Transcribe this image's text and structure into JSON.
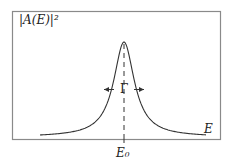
{
  "figure": {
    "y_axis_label": "|A(E)|²",
    "x_axis_label": "E",
    "center_tick_label": "E₀",
    "width_label": "Γ",
    "colors": {
      "frame": "#8a8a8a",
      "curve": "#333333",
      "text": "#222222"
    }
  },
  "chart_data": {
    "type": "line",
    "title": "",
    "xlabel": "E",
    "ylabel": "|A(E)|²",
    "annotations": [
      {
        "text": "E₀",
        "meaning": "resonance center, marked by dashed vertical line"
      },
      {
        "text": "Γ",
        "meaning": "full width at half maximum, indicated by inward arrows"
      }
    ],
    "grid": false,
    "legend": null,
    "x": [
      -7,
      -5,
      -3,
      -2,
      -1,
      -0.5,
      0,
      0.5,
      1,
      2,
      3,
      5,
      7
    ],
    "values": [
      0.02,
      0.038,
      0.1,
      0.2,
      0.5,
      0.8,
      1.0,
      0.8,
      0.5,
      0.2,
      0.1,
      0.038,
      0.02
    ],
    "x_units": "(E - E₀)/(Γ/2)",
    "y_units": "normalized to peak"
  }
}
